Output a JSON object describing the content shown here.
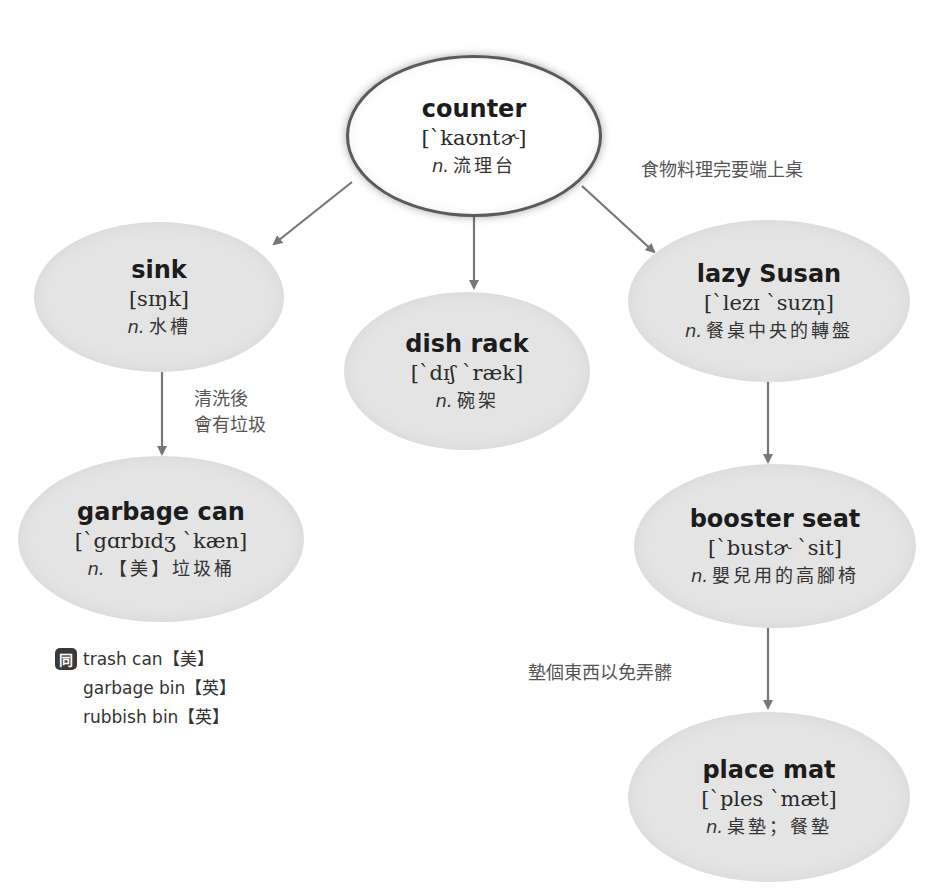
{
  "colors": {
    "node_fill": "#e4e4e4",
    "root_fill": "#ffffff",
    "root_border": "#5a5a5a",
    "arrow": "#777777",
    "text": "#1c1c1c",
    "note_text": "#555555"
  },
  "nodes": {
    "counter": {
      "term": "counter",
      "ipa": "[`kaʊntɚ]",
      "pos": "n.",
      "definition": "流理台"
    },
    "sink": {
      "term": "sink",
      "ipa": "[sɪŋk]",
      "pos": "n.",
      "definition": "水槽"
    },
    "dish_rack": {
      "term": "dish rack",
      "ipa": "[`dɪʃ `ræk]",
      "pos": "n.",
      "definition": "碗架"
    },
    "lazy_susan": {
      "term": "lazy Susan",
      "ipa": "[`lezɪ `suzn̩]",
      "pos": "n.",
      "definition": "餐桌中央的轉盤"
    },
    "garbage_can": {
      "term": "garbage can",
      "ipa": "[`gɑrbɪdʒ `kæn]",
      "pos": "n.",
      "definition": "【美】垃圾桶"
    },
    "booster_seat": {
      "term": "booster seat",
      "ipa": "[`bustɚ `sit]",
      "pos": "n.",
      "definition": "嬰兒用的高腳椅"
    },
    "place_mat": {
      "term": "place mat",
      "ipa": "[`ples `mæt]",
      "pos": "n.",
      "definition": "桌墊；餐墊"
    }
  },
  "notes": {
    "counter_to_lazy_susan": "食物料理完要端上桌",
    "sink_to_garbage_line1": "清洗後",
    "sink_to_garbage_line2": "會有垃圾",
    "booster_to_place_mat": "墊個東西以免弄髒"
  },
  "synonyms": {
    "icon_label": "同",
    "items": [
      "trash can【美】",
      "garbage bin【英】",
      "rubbish bin【英】"
    ]
  },
  "edges": [
    {
      "from": "counter",
      "to": "sink"
    },
    {
      "from": "counter",
      "to": "dish_rack"
    },
    {
      "from": "counter",
      "to": "lazy_susan"
    },
    {
      "from": "sink",
      "to": "garbage_can"
    },
    {
      "from": "lazy_susan",
      "to": "booster_seat"
    },
    {
      "from": "booster_seat",
      "to": "place_mat"
    }
  ]
}
